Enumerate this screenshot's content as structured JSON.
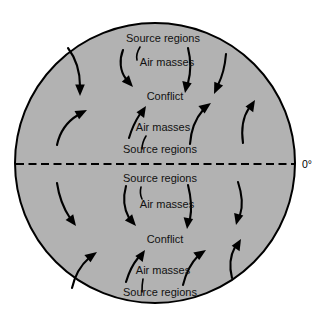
{
  "figure": {
    "background_color": "#ffffff",
    "globe": {
      "fill_color": "#b2b2b2",
      "outline_color": "#000000",
      "center_x": 155,
      "center_y": 163,
      "radius": 140
    },
    "equator": {
      "label": "0°",
      "style": "dashed",
      "y": 164,
      "color": "#000000"
    }
  },
  "labels": {
    "northern": {
      "source_regions_outer": "Source regions",
      "air_masses_outer": "Air masses",
      "conflict": "Conflict",
      "air_masses_inner": "Air masses",
      "source_regions_inner": "Source regions"
    },
    "southern": {
      "source_regions_inner": "Source regions",
      "air_masses_inner": "Air masses",
      "conflict": "Conflict",
      "air_masses_outer": "Air masses",
      "source_regions_outer": "Source regions"
    }
  },
  "label_positions": [
    {
      "name": "north-source-regions-polar",
      "text": "Source regions",
      "x": 163,
      "y": 42
    },
    {
      "name": "north-air-masses-polar",
      "text": "Air masses",
      "x": 167,
      "y": 66
    },
    {
      "name": "north-conflict",
      "text": "Conflict",
      "x": 165,
      "y": 100
    },
    {
      "name": "north-air-masses-equatorial",
      "text": "Air masses",
      "x": 163,
      "y": 131
    },
    {
      "name": "north-source-regions-equatorial",
      "text": "Source regions",
      "x": 160,
      "y": 153
    },
    {
      "name": "south-source-regions-equatorial",
      "text": "Source regions",
      "x": 160,
      "y": 182
    },
    {
      "name": "south-air-masses-equatorial",
      "text": "Air masses",
      "x": 167,
      "y": 208
    },
    {
      "name": "south-conflict",
      "text": "Conflict",
      "x": 165,
      "y": 243
    },
    {
      "name": "south-air-masses-polar",
      "text": "Air masses",
      "x": 163,
      "y": 274
    },
    {
      "name": "south-source-regions-polar",
      "text": "Source regions",
      "x": 160,
      "y": 296
    }
  ],
  "arrows": [
    {
      "name": "north-polar-left-inflow",
      "direction": "down-right",
      "hemisphere": "north"
    },
    {
      "name": "north-polar-center-inflow",
      "direction": "down-right",
      "hemisphere": "north"
    },
    {
      "name": "north-polar-midright-inflow",
      "direction": "down-right",
      "hemisphere": "north"
    },
    {
      "name": "north-polar-right-inflow",
      "direction": "down-right",
      "hemisphere": "north"
    },
    {
      "name": "north-equatorial-left-inflow",
      "direction": "up-right",
      "hemisphere": "north"
    },
    {
      "name": "north-equatorial-center-inflow",
      "direction": "up-right",
      "hemisphere": "north"
    },
    {
      "name": "north-equatorial-midright-inflow",
      "direction": "up-right",
      "hemisphere": "north"
    },
    {
      "name": "north-equatorial-right-inflow",
      "direction": "up-right",
      "hemisphere": "north"
    },
    {
      "name": "south-equatorial-left-inflow",
      "direction": "down-right",
      "hemisphere": "south"
    },
    {
      "name": "south-equatorial-center-inflow",
      "direction": "down-right",
      "hemisphere": "south"
    },
    {
      "name": "south-equatorial-midright-inflow",
      "direction": "down-right",
      "hemisphere": "south"
    },
    {
      "name": "south-equatorial-right-inflow",
      "direction": "down-right",
      "hemisphere": "south"
    },
    {
      "name": "south-polar-left-inflow",
      "direction": "up-right",
      "hemisphere": "south"
    },
    {
      "name": "south-polar-center-inflow",
      "direction": "up-right",
      "hemisphere": "south"
    },
    {
      "name": "south-polar-midright-inflow",
      "direction": "up-right",
      "hemisphere": "south"
    },
    {
      "name": "south-polar-right-inflow",
      "direction": "up-right",
      "hemisphere": "south"
    }
  ]
}
